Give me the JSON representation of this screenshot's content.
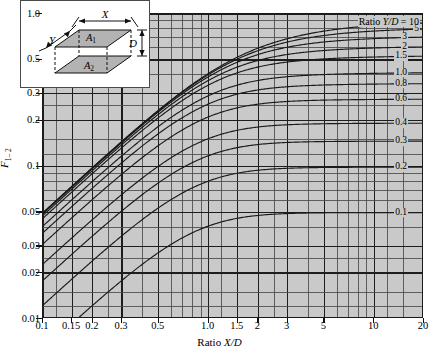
{
  "chart": {
    "type": "line",
    "title": "",
    "xlabel": "Ratio X/D",
    "xlabel_prefix": "Ratio ",
    "xlabel_sym": "X/D",
    "ylabel_sym": "F",
    "ylabel_sub": "1– 2",
    "ylabel": "F 1-2",
    "xscale": "log",
    "yscale": "log",
    "xlim": [
      0.1,
      20
    ],
    "ylim": [
      0.01,
      1.0
    ],
    "grid": true,
    "legend_position": "right-inline",
    "legend_title": "Ratio Y/D = 10",
    "legend_title_prefix": "Ratio ",
    "legend_title_sym": "Y/D",
    "legend_title_eq": " = 10",
    "xticks": [
      {
        "v": 0.1,
        "label": "0.1"
      },
      {
        "v": 0.15,
        "label": "0.15"
      },
      {
        "v": 0.2,
        "label": "0.2"
      },
      {
        "v": 0.3,
        "label": "0.3"
      },
      {
        "v": 0.5,
        "label": "0.5"
      },
      {
        "v": 1.0,
        "label": "1.0"
      },
      {
        "v": 1.5,
        "label": "1.5"
      },
      {
        "v": 2.0,
        "label": "2"
      },
      {
        "v": 3.0,
        "label": "3"
      },
      {
        "v": 5.0,
        "label": "5"
      },
      {
        "v": 10.0,
        "label": "10"
      },
      {
        "v": 20.0,
        "label": "20"
      }
    ],
    "yticks": [
      {
        "v": 1.0,
        "label": "1.0"
      },
      {
        "v": 0.5,
        "label": "0.5"
      },
      {
        "v": 0.3,
        "label": "0.3"
      },
      {
        "v": 0.2,
        "label": "0.2"
      },
      {
        "v": 0.1,
        "label": "0.1"
      },
      {
        "v": 0.05,
        "label": "0.05"
      },
      {
        "v": 0.03,
        "label": "0.03"
      },
      {
        "v": 0.02,
        "label": "0.02"
      },
      {
        "v": 0.01,
        "label": "0.01"
      }
    ],
    "xminor": [
      0.1,
      0.12,
      0.15,
      0.2,
      0.25,
      0.3,
      0.4,
      0.5,
      0.6,
      0.7,
      0.8,
      0.9,
      1.0,
      1.2,
      1.5,
      2,
      2.5,
      3,
      4,
      5,
      6,
      7,
      8,
      9,
      10,
      12,
      15,
      20
    ],
    "yminor": [
      0.01,
      0.012,
      0.015,
      0.02,
      0.025,
      0.03,
      0.04,
      0.05,
      0.06,
      0.07,
      0.08,
      0.09,
      0.1,
      0.12,
      0.15,
      0.2,
      0.25,
      0.3,
      0.4,
      0.5,
      0.6,
      0.7,
      0.8,
      0.9,
      1.0
    ],
    "series": [
      {
        "name": "10",
        "yd": 10,
        "label": "10"
      },
      {
        "name": "5",
        "yd": 5,
        "label": "5"
      },
      {
        "name": "3",
        "yd": 3,
        "label": "3"
      },
      {
        "name": "2",
        "yd": 2,
        "label": "2"
      },
      {
        "name": "1.5",
        "yd": 1.5,
        "label": "1.5"
      },
      {
        "name": "1.0",
        "yd": 1.0,
        "label": "1.0"
      },
      {
        "name": "0.8",
        "yd": 0.8,
        "label": "0.8"
      },
      {
        "name": "0.6",
        "yd": 0.6,
        "label": "0.6"
      },
      {
        "name": "0.4",
        "yd": 0.4,
        "label": "0.4"
      },
      {
        "name": "0.3",
        "yd": 0.3,
        "label": "0.3"
      },
      {
        "name": "0.2",
        "yd": 0.2,
        "label": "0.2"
      },
      {
        "name": "0.1",
        "yd": 0.1,
        "label": "0.1"
      }
    ],
    "colors": {
      "plot_background": "#c9c9c9",
      "grid_major": "#1d1d1d",
      "grid_minor": "#4a4a4a",
      "curve": "#1a1a1a",
      "page_background": "#ffffff"
    }
  },
  "inset": {
    "label_x": "X",
    "label_y": "Y",
    "label_d": "D",
    "label_a1": "A",
    "label_a1_sub": "1",
    "label_a2": "A",
    "label_a2_sub": "2",
    "face_fill": "#b3b3b3",
    "background": "#ffffff"
  }
}
